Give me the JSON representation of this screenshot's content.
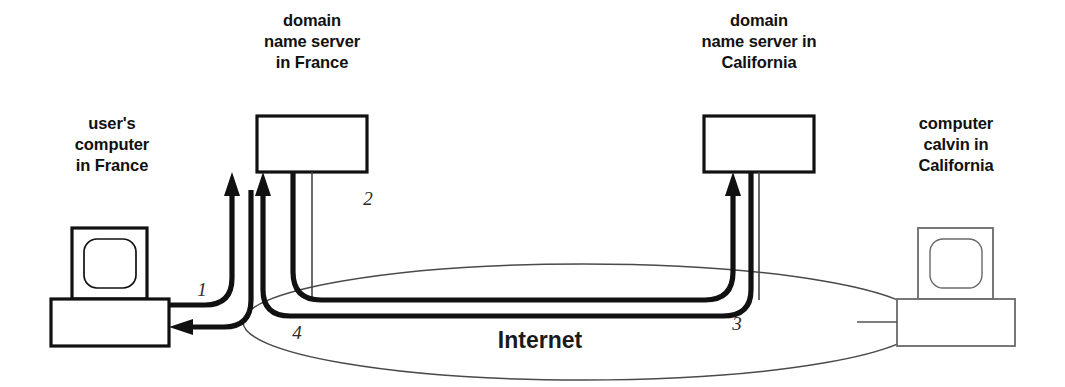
{
  "figure": {
    "cloud_label": "Internet",
    "colors": {
      "ink": "#111111",
      "flow": "#111111",
      "cloud_outline": "#4a4a4a",
      "remote_device": "#6a6a6a",
      "background": "#ffffff"
    }
  },
  "nodes": {
    "user_computer": {
      "name": "user-computer-france",
      "label_lines": [
        "user's",
        "computer",
        "in France"
      ],
      "kind": "desktop-computer"
    },
    "dns_france": {
      "name": "domain-name-server-france",
      "label_lines": [
        "domain",
        "name server",
        "in France"
      ],
      "kind": "server-box"
    },
    "dns_california": {
      "name": "domain-name-server-california",
      "label_lines": [
        "domain",
        "name server in",
        "California"
      ],
      "kind": "server-box"
    },
    "computer_calvin": {
      "name": "computer-calvin-california",
      "label_lines": [
        "computer",
        "calvin in",
        "California"
      ],
      "kind": "desktop-computer"
    }
  },
  "steps": [
    {
      "number": "1",
      "description": "query from user's computer to domain name server in France"
    },
    {
      "number": "2",
      "description": "query from domain name server in France out to the Internet"
    },
    {
      "number": "3",
      "description": "query arrives at domain name server in California"
    },
    {
      "number": "4",
      "description": "answer returns to the user's computer in France"
    }
  ]
}
